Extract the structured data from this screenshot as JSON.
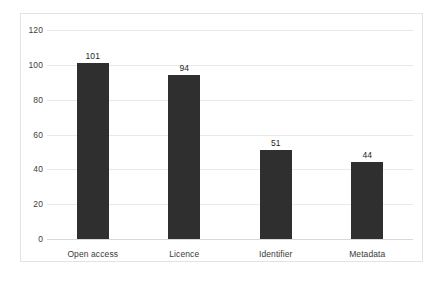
{
  "chart_data": {
    "type": "bar",
    "title": "",
    "subtitle": "",
    "xlabel": "",
    "ylabel": "",
    "categories": [
      "Open access",
      "Licence",
      "Identifier",
      "Metadata"
    ],
    "values": [
      101,
      94,
      51,
      44
    ],
    "data_labels": [
      "101",
      "94",
      "51",
      "44"
    ],
    "ylim": [
      0,
      120
    ],
    "yticks": [
      0,
      20,
      40,
      60,
      80,
      100,
      120
    ],
    "ytick_labels": [
      "0",
      "20",
      "40",
      "60",
      "80",
      "100",
      "120"
    ],
    "grid": "horizontal",
    "legend": "none",
    "series": [
      {
        "name": "",
        "values": [
          101,
          94,
          51,
          44
        ]
      }
    ],
    "colors": {
      "bar": "#2f2f2f",
      "gridline": "#e9e9e9",
      "baseline": "#d9d9d9",
      "frame_border": "#e3e3e3",
      "background": "#ffffff",
      "tick_text": "#404040",
      "label_text": "#262626"
    }
  }
}
